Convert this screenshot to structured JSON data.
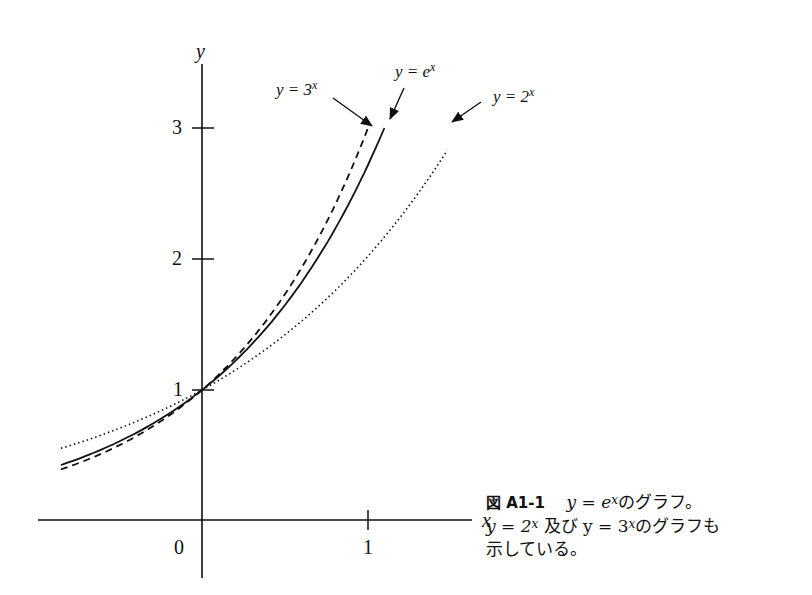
{
  "chart_data": {
    "type": "line",
    "title": "",
    "xlabel": "x",
    "ylabel": "y",
    "xlim": [
      -0.86,
      1.6
    ],
    "ylim": [
      0,
      3.5
    ],
    "grid": false,
    "legend_position": "inline-annotations",
    "x_ticks": [
      {
        "value": 0,
        "label": "0"
      },
      {
        "value": 1,
        "label": "1"
      }
    ],
    "y_ticks": [
      {
        "value": 1,
        "label": "1"
      },
      {
        "value": 2,
        "label": "2"
      },
      {
        "value": 3,
        "label": "3"
      }
    ],
    "series": [
      {
        "name": "y = 3^x",
        "style": "dashed",
        "x": [
          -0.85,
          -0.5,
          0,
          0.5,
          1.0
        ],
        "values": [
          0.39,
          0.58,
          1.0,
          1.73,
          3.0
        ]
      },
      {
        "name": "y = e^x",
        "style": "solid",
        "x": [
          -0.85,
          -0.5,
          0,
          0.5,
          1.0986
        ],
        "values": [
          0.43,
          0.61,
          1.0,
          1.65,
          3.0
        ]
      },
      {
        "name": "y = 2^x",
        "style": "dotted",
        "x": [
          -0.85,
          -0.5,
          0,
          0.5,
          1.0,
          1.5
        ],
        "values": [
          0.55,
          0.71,
          1.0,
          1.41,
          2.0,
          2.83
        ]
      }
    ],
    "annotations": [
      {
        "text": "y = 3^x",
        "points_to": "end of dashed curve"
      },
      {
        "text": "y = e^x",
        "points_to": "end of solid curve"
      },
      {
        "text": "y = 2^x",
        "points_to": "end of dotted curve"
      }
    ]
  },
  "axes": {
    "x_label": "x",
    "y_label": "y",
    "origin_label": "0",
    "x_tick_1": "1",
    "y_tick_1": "1",
    "y_tick_2": "2",
    "y_tick_3": "3"
  },
  "annotations": {
    "three": {
      "base": "y = 3",
      "exp": "x"
    },
    "e": {
      "base": "y = e",
      "exp": "x"
    },
    "two": {
      "base": "y = 2",
      "exp": "x"
    }
  },
  "caption": {
    "figure_number": "図 A1-1",
    "line1_a": "y = e",
    "line1_exp": "x",
    "line1_b": "のグラフ。",
    "line2_a": "y = 2",
    "line2_exp1": "x",
    "line2_b": " 及び y = 3",
    "line2_exp2": "x",
    "line2_c": "のグラフも",
    "line3": "示している。"
  }
}
